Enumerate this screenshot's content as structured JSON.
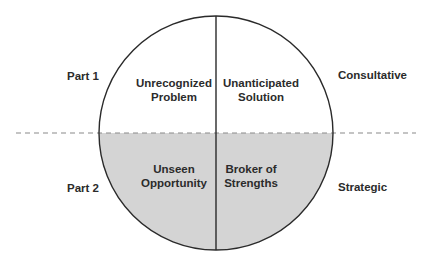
{
  "diagram": {
    "colors": {
      "outline": "#2a2a2a",
      "fill_bottom": "#d4d4d4",
      "dash": "#8a8a8a",
      "text": "#2b2b2b"
    },
    "left_labels": {
      "top": "Part 1",
      "bottom": "Part 2"
    },
    "right_labels": {
      "top": "Consultative",
      "bottom": "Strategic"
    },
    "quadrants": {
      "top_left": {
        "line1": "Unrecognized",
        "line2": "Problem"
      },
      "top_right": {
        "line1": "Unanticipated",
        "line2": "Solution"
      },
      "bottom_left": {
        "line1": "Unseen",
        "line2": "Opportunity"
      },
      "bottom_right": {
        "line1": "Broker of",
        "line2": "Strengths"
      }
    }
  }
}
